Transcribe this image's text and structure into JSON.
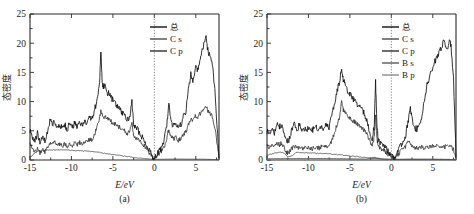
{
  "figure": {
    "panels": [
      {
        "id": "a",
        "panel_label": "(a)",
        "xlabel": "E/eV",
        "ylabel": "态密度",
        "legend": [
          {
            "label": "总",
            "color": "#111111",
            "key": "total"
          },
          {
            "label": "C s",
            "color": "#4a4a4a",
            "key": "cs"
          },
          {
            "label": "C p",
            "color": "#2e2e2e",
            "key": "cp"
          }
        ]
      },
      {
        "id": "b",
        "panel_label": "(b)",
        "xlabel": "E/eV",
        "ylabel": "态密度",
        "legend": [
          {
            "label": "总",
            "color": "#111111",
            "key": "total"
          },
          {
            "label": "C s",
            "color": "#4a4a4a",
            "key": "cs"
          },
          {
            "label": "C p",
            "color": "#2e2e2e",
            "key": "cp"
          },
          {
            "label": "B s",
            "color": "#5a5a5a",
            "key": "bs"
          },
          {
            "label": "B p",
            "color": "#8d8d8d",
            "key": "bp"
          }
        ]
      }
    ],
    "xticklabels": [
      "-15",
      "-10",
      "-5",
      "0",
      "5"
    ],
    "yticklabels": [
      "0",
      "5",
      "10",
      "15",
      "20",
      "25"
    ]
  },
  "chart_data": [
    {
      "type": "line",
      "title": "(a)",
      "xlabel": "E/eV",
      "ylabel": "态密度",
      "xlim": [
        -15,
        7.8
      ],
      "ylim": [
        0,
        25
      ],
      "xticks": [
        -15,
        -10,
        -5,
        0,
        5
      ],
      "yticks": [
        0,
        5,
        10,
        15,
        20,
        25
      ],
      "grid": false,
      "legend_position": "top-right",
      "annotations": [
        {
          "type": "vline",
          "x": 0,
          "style": "dotted",
          "label": "Fermi level"
        }
      ],
      "series": [
        {
          "name": "总",
          "x": [
            -15.0,
            -14.7,
            -14.4,
            -14.1,
            -13.8,
            -13.5,
            -13.2,
            -12.9,
            -12.6,
            -12.3,
            -12.0,
            -11.7,
            -11.4,
            -11.1,
            -10.8,
            -10.5,
            -10.2,
            -9.9,
            -9.6,
            -9.3,
            -9.0,
            -8.7,
            -8.4,
            -8.1,
            -7.8,
            -7.5,
            -7.2,
            -6.9,
            -6.6,
            -6.45,
            -6.3,
            -6.15,
            -6.0,
            -5.7,
            -5.4,
            -5.1,
            -4.8,
            -4.5,
            -4.2,
            -3.9,
            -3.6,
            -3.3,
            -3.0,
            -2.7,
            -2.5,
            -2.3,
            -2.0,
            -1.7,
            -1.4,
            -1.1,
            -0.8,
            -0.5,
            -0.2,
            0.0,
            0.3,
            0.6,
            0.9,
            1.2,
            1.5,
            1.75,
            2.0,
            2.3,
            2.6,
            2.9,
            3.2,
            3.5,
            3.8,
            4.1,
            4.4,
            4.7,
            5.0,
            5.3,
            5.6,
            5.9,
            6.2,
            6.4,
            6.7,
            7.0,
            7.3,
            7.6,
            7.8
          ],
          "values": [
            5.2,
            4.0,
            3.2,
            4.6,
            3.0,
            4.2,
            3.1,
            5.0,
            6.8,
            6.0,
            6.6,
            5.6,
            6.2,
            5.4,
            6.1,
            5.2,
            6.4,
            5.5,
            6.5,
            5.6,
            6.6,
            5.8,
            7.0,
            6.2,
            7.4,
            7.0,
            8.6,
            10.5,
            13.0,
            19.0,
            13.5,
            12.4,
            12.8,
            11.6,
            11.2,
            10.4,
            10.0,
            9.2,
            8.8,
            8.0,
            7.6,
            6.8,
            7.2,
            9.9,
            6.4,
            5.6,
            5.2,
            4.4,
            3.8,
            3.0,
            2.2,
            1.4,
            0.6,
            0.15,
            1.0,
            1.6,
            2.2,
            3.4,
            6.0,
            9.9,
            6.6,
            5.8,
            6.2,
            5.4,
            6.0,
            7.4,
            8.2,
            12.0,
            14.6,
            13.4,
            16.2,
            15.2,
            18.0,
            19.4,
            21.3,
            19.2,
            17.8,
            16.5,
            12.0,
            5.0,
            0.4
          ]
        },
        {
          "name": "C p",
          "x": [
            -15.0,
            -14.7,
            -14.4,
            -14.1,
            -13.8,
            -13.5,
            -13.2,
            -12.9,
            -12.6,
            -12.3,
            -12.0,
            -11.7,
            -11.4,
            -11.1,
            -10.8,
            -10.5,
            -10.2,
            -9.9,
            -9.6,
            -9.3,
            -9.0,
            -8.7,
            -8.4,
            -8.1,
            -7.8,
            -7.5,
            -7.2,
            -6.9,
            -6.6,
            -6.45,
            -6.3,
            -6.15,
            -6.0,
            -5.7,
            -5.4,
            -5.1,
            -4.8,
            -4.5,
            -4.2,
            -3.9,
            -3.6,
            -3.3,
            -3.0,
            -2.7,
            -2.5,
            -2.3,
            -2.0,
            -1.7,
            -1.4,
            -1.1,
            -0.8,
            -0.5,
            -0.2,
            0.0,
            0.3,
            0.6,
            0.9,
            1.2,
            1.5,
            1.75,
            2.0,
            2.3,
            2.6,
            2.9,
            3.2,
            3.5,
            3.8,
            4.1,
            4.4,
            4.7,
            5.0,
            5.3,
            5.6,
            5.9,
            6.2,
            6.4,
            6.7,
            7.0,
            7.3,
            7.6,
            7.8
          ],
          "values": [
            2.6,
            1.8,
            1.4,
            2.0,
            1.2,
            1.7,
            1.3,
            2.2,
            3.0,
            2.6,
            3.0,
            2.5,
            2.8,
            2.4,
            2.8,
            2.3,
            2.9,
            2.5,
            3.0,
            2.6,
            3.1,
            2.7,
            3.3,
            3.0,
            3.6,
            3.5,
            4.4,
            5.6,
            7.2,
            8.4,
            7.6,
            7.2,
            7.4,
            7.0,
            6.9,
            6.4,
            6.2,
            5.8,
            5.6,
            5.2,
            5.0,
            4.5,
            4.8,
            6.2,
            4.3,
            3.9,
            3.6,
            3.1,
            2.7,
            2.2,
            1.6,
            1.0,
            0.45,
            0.1,
            0.7,
            1.1,
            1.5,
            2.3,
            3.6,
            5.4,
            4.0,
            3.6,
            3.8,
            3.3,
            3.7,
            4.4,
            4.8,
            6.2,
            7.2,
            6.8,
            7.6,
            7.2,
            8.2,
            8.8,
            9.4,
            8.6,
            8.0,
            7.4,
            5.6,
            2.6,
            0.25
          ]
        },
        {
          "name": "C s",
          "x": [
            -15.0,
            -14.5,
            -14.0,
            -13.5,
            -13.0,
            -12.5,
            -12.0,
            -11.5,
            -11.0,
            -10.5,
            -10.0,
            -9.5,
            -9.0,
            -8.5,
            -8.0,
            -7.5,
            -7.0,
            -6.5,
            -6.0,
            -5.5,
            -5.0,
            -4.5,
            -4.0,
            -3.5,
            -3.0,
            -2.5,
            -2.0,
            -1.5,
            -1.0,
            -0.5,
            0.0,
            0.5,
            1.0,
            1.5,
            2.0,
            3.0,
            4.0,
            5.0,
            6.0,
            7.0,
            7.8
          ],
          "values": [
            0.4,
            1.1,
            1.5,
            1.6,
            1.65,
            1.7,
            1.75,
            1.75,
            1.7,
            1.7,
            1.65,
            1.6,
            1.6,
            1.55,
            1.5,
            1.45,
            1.35,
            1.25,
            1.15,
            1.05,
            0.95,
            0.85,
            0.75,
            0.65,
            0.55,
            0.45,
            0.38,
            0.3,
            0.22,
            0.16,
            0.12,
            0.12,
            0.13,
            0.14,
            0.15,
            0.15,
            0.15,
            0.14,
            0.13,
            0.1,
            0.05
          ]
        }
      ]
    },
    {
      "type": "line",
      "title": "(b)",
      "xlabel": "E/eV",
      "ylabel": "态密度",
      "xlim": [
        -15,
        7.8
      ],
      "ylim": [
        0,
        25
      ],
      "xticks": [
        -15,
        -10,
        -5,
        0,
        5
      ],
      "yticks": [
        0,
        5,
        10,
        15,
        20,
        25
      ],
      "grid": false,
      "legend_position": "top-right",
      "annotations": [
        {
          "type": "vline",
          "x": 0,
          "style": "dotted",
          "label": "Fermi level"
        }
      ],
      "series": [
        {
          "name": "总",
          "x": [
            -15.0,
            -14.7,
            -14.4,
            -14.1,
            -13.8,
            -13.5,
            -13.2,
            -12.9,
            -12.6,
            -12.3,
            -12.0,
            -11.7,
            -11.4,
            -11.1,
            -10.8,
            -10.5,
            -10.2,
            -9.9,
            -9.6,
            -9.3,
            -9.0,
            -8.7,
            -8.4,
            -8.1,
            -7.8,
            -7.5,
            -7.2,
            -6.9,
            -6.6,
            -6.3,
            -6.0,
            -5.8,
            -5.6,
            -5.3,
            -5.0,
            -4.7,
            -4.4,
            -4.1,
            -3.8,
            -3.5,
            -3.2,
            -2.9,
            -2.6,
            -2.3,
            -2.05,
            -1.9,
            -1.75,
            -1.6,
            -1.3,
            -1.0,
            -0.7,
            -0.4,
            -0.1,
            0.2,
            0.5,
            0.8,
            1.1,
            1.4,
            1.7,
            2.0,
            2.3,
            2.5,
            2.8,
            3.1,
            3.4,
            3.7,
            4.0,
            4.3,
            4.6,
            4.9,
            5.2,
            5.5,
            5.8,
            6.1,
            6.4,
            6.7,
            7.0,
            7.2,
            7.5,
            7.8
          ],
          "values": [
            5.0,
            4.2,
            5.4,
            4.6,
            6.4,
            5.6,
            6.2,
            4.2,
            3.0,
            3.6,
            5.2,
            6.0,
            5.2,
            6.0,
            5.0,
            5.4,
            5.2,
            5.6,
            5.0,
            5.4,
            5.6,
            5.2,
            5.8,
            5.4,
            6.0,
            5.6,
            7.4,
            9.6,
            11.6,
            13.2,
            15.8,
            13.6,
            13.0,
            12.0,
            11.4,
            10.6,
            10.2,
            9.6,
            9.0,
            8.4,
            7.8,
            6.4,
            5.0,
            3.4,
            6.2,
            13.6,
            6.0,
            3.6,
            3.0,
            2.6,
            2.2,
            1.6,
            1.0,
            0.5,
            0.6,
            1.4,
            2.4,
            3.2,
            4.0,
            6.4,
            8.8,
            7.0,
            5.6,
            5.2,
            5.8,
            7.6,
            10.2,
            12.8,
            14.2,
            15.4,
            16.6,
            17.8,
            18.6,
            19.6,
            20.4,
            19.0,
            20.2,
            19.6,
            14.0,
            0.5
          ]
        },
        {
          "name": "C p",
          "x": [
            -15.0,
            -14.7,
            -14.4,
            -14.1,
            -13.8,
            -13.5,
            -13.2,
            -12.9,
            -12.6,
            -12.3,
            -12.0,
            -11.7,
            -11.4,
            -11.1,
            -10.8,
            -10.5,
            -10.2,
            -9.9,
            -9.6,
            -9.3,
            -9.0,
            -8.7,
            -8.4,
            -8.1,
            -7.8,
            -7.5,
            -7.2,
            -6.9,
            -6.6,
            -6.3,
            -6.0,
            -5.8,
            -5.6,
            -5.3,
            -5.0,
            -4.7,
            -4.4,
            -4.1,
            -3.8,
            -3.5,
            -3.2,
            -2.9,
            -2.6,
            -2.3,
            -2.05,
            -1.9,
            -1.75,
            -1.6,
            -1.3,
            -1.0,
            -0.7,
            -0.4,
            -0.1,
            0.2,
            0.5,
            0.8,
            1.1,
            1.4,
            1.7,
            2.0,
            2.3,
            2.5,
            2.8,
            3.1,
            3.4,
            3.7,
            4.0,
            4.3,
            4.6,
            4.9,
            5.2,
            5.5,
            5.8,
            6.1,
            6.4,
            6.7,
            7.0,
            7.2,
            7.5,
            7.8
          ],
          "values": [
            2.4,
            2.0,
            2.6,
            2.2,
            3.0,
            2.6,
            2.9,
            1.9,
            1.2,
            1.4,
            2.0,
            2.3,
            2.0,
            2.3,
            1.9,
            2.1,
            2.0,
            2.2,
            1.9,
            2.1,
            2.2,
            2.0,
            2.3,
            2.1,
            2.4,
            2.3,
            3.2,
            4.6,
            5.8,
            7.0,
            10.2,
            8.6,
            8.2,
            7.6,
            7.2,
            6.8,
            6.5,
            6.2,
            5.8,
            5.4,
            5.0,
            4.2,
            3.4,
            2.4,
            4.0,
            8.0,
            3.8,
            2.4,
            2.0,
            1.7,
            1.4,
            1.0,
            0.7,
            0.35,
            0.4,
            0.9,
            1.5,
            1.9,
            2.3,
            3.4,
            2.6,
            2.2,
            2.0,
            2.1,
            2.0,
            2.2,
            2.1,
            2.3,
            2.2,
            2.4,
            2.3,
            2.5,
            2.3,
            2.4,
            2.2,
            2.4,
            2.2,
            2.3,
            1.8,
            0.3
          ]
        },
        {
          "name": "C s",
          "x": [
            -15.0,
            -14.5,
            -14.0,
            -13.5,
            -13.0,
            -12.5,
            -12.0,
            -11.5,
            -11.0,
            -10.5,
            -10.0,
            -9.5,
            -9.0,
            -8.5,
            -8.0,
            -7.5,
            -7.0,
            -6.5,
            -6.0,
            -5.5,
            -5.0,
            -4.5,
            -4.0,
            -3.5,
            -3.0,
            -2.5,
            -2.0,
            -1.5,
            -1.0,
            -0.5,
            0.0,
            1.0,
            2.0,
            3.0,
            4.0,
            5.0,
            6.0,
            7.0,
            7.8
          ],
          "values": [
            0.8,
            1.0,
            1.2,
            1.3,
            1.25,
            0.55,
            0.7,
            1.3,
            1.3,
            1.25,
            1.2,
            1.2,
            1.15,
            1.15,
            1.1,
            1.05,
            1.0,
            0.9,
            0.85,
            0.8,
            0.7,
            0.62,
            0.55,
            0.48,
            0.4,
            0.34,
            0.3,
            0.24,
            0.2,
            0.15,
            0.12,
            0.12,
            0.13,
            0.13,
            0.13,
            0.12,
            0.11,
            0.1,
            0.05
          ]
        },
        {
          "name": "B s",
          "x": [
            -15.0,
            -13.0,
            -11.0,
            -9.0,
            -7.0,
            -5.0,
            -3.0,
            -2.0,
            -1.0,
            0.0,
            1.0,
            2.0,
            3.0,
            4.0,
            5.0,
            6.0,
            7.0,
            7.8
          ],
          "values": [
            0.22,
            0.24,
            0.26,
            0.26,
            0.24,
            0.2,
            0.16,
            0.45,
            0.12,
            0.1,
            0.1,
            0.12,
            0.12,
            0.12,
            0.12,
            0.11,
            0.1,
            0.05
          ]
        },
        {
          "name": "B p",
          "x": [
            -15.0,
            -13.0,
            -11.0,
            -9.0,
            -7.0,
            -5.0,
            -3.0,
            -2.0,
            -1.0,
            0.0,
            1.0,
            2.0,
            3.0,
            4.0,
            5.0,
            6.0,
            7.0,
            7.8
          ],
          "values": [
            0.12,
            0.13,
            0.14,
            0.14,
            0.13,
            0.12,
            0.1,
            0.3,
            0.09,
            0.08,
            0.08,
            0.09,
            0.09,
            0.09,
            0.09,
            0.08,
            0.08,
            0.04
          ]
        }
      ]
    }
  ]
}
